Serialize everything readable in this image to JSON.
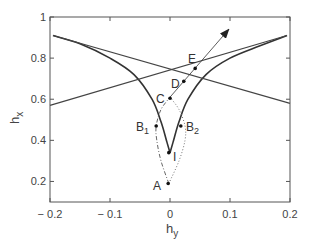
{
  "chart_data": {
    "type": "line",
    "title": "",
    "xlabel": "h_y",
    "ylabel": "h_x",
    "xlim": [
      -0.2,
      0.2
    ],
    "ylim": [
      0.1,
      1.0
    ],
    "grid": false,
    "xticks": [
      {
        "value": -0.2,
        "label": "− 0.2"
      },
      {
        "value": -0.1,
        "label": "− 0.1"
      },
      {
        "value": 0,
        "label": "0"
      },
      {
        "value": 0.1,
        "label": "0.1"
      },
      {
        "value": 0.2,
        "label": "0.2"
      }
    ],
    "yticks": [
      {
        "value": 0.2,
        "label": "0.2"
      },
      {
        "value": 0.4,
        "label": "0.4"
      },
      {
        "value": 0.6,
        "label": "0.6"
      },
      {
        "value": 0.8,
        "label": "0.8"
      },
      {
        "value": 1.0,
        "label": "1"
      }
    ],
    "series": [
      {
        "name": "astroid-left-branch",
        "style": "solid-thick",
        "points": [
          [
            -0.195,
            0.91
          ],
          [
            -0.15,
            0.87
          ],
          [
            -0.1,
            0.8
          ],
          [
            -0.06,
            0.72
          ],
          [
            -0.03,
            0.6
          ],
          [
            -0.015,
            0.49
          ],
          [
            -0.005,
            0.39
          ],
          [
            0,
            0.34
          ]
        ]
      },
      {
        "name": "astroid-right-branch",
        "style": "solid-thick",
        "points": [
          [
            0,
            0.34
          ],
          [
            0.005,
            0.39
          ],
          [
            0.015,
            0.49
          ],
          [
            0.03,
            0.6
          ],
          [
            0.06,
            0.72
          ],
          [
            0.1,
            0.8
          ],
          [
            0.15,
            0.86
          ],
          [
            0.195,
            0.91
          ]
        ]
      },
      {
        "name": "tangent-line-1",
        "style": "solid",
        "points": [
          [
            -0.195,
            0.91
          ],
          [
            0.2,
            0.58
          ]
        ]
      },
      {
        "name": "tangent-line-2",
        "style": "solid",
        "points": [
          [
            -0.2,
            0.57
          ],
          [
            0.195,
            0.91
          ]
        ]
      },
      {
        "name": "path-A-B1-C",
        "style": "dash-dot",
        "points": [
          [
            -0.002,
            0.19
          ],
          [
            -0.015,
            0.3
          ],
          [
            -0.022,
            0.4
          ],
          [
            -0.023,
            0.47
          ],
          [
            -0.015,
            0.55
          ],
          [
            0,
            0.61
          ]
        ]
      },
      {
        "name": "path-A-B2-C",
        "style": "dotted",
        "points": [
          [
            -0.002,
            0.19
          ],
          [
            0.015,
            0.3
          ],
          [
            0.025,
            0.4
          ],
          [
            0.025,
            0.47
          ],
          [
            0.015,
            0.55
          ],
          [
            0,
            0.61
          ]
        ]
      },
      {
        "name": "field-arrow",
        "style": "thin-arrow",
        "points": [
          [
            0,
            0.61
          ],
          [
            0.098,
            0.94
          ]
        ]
      }
    ],
    "annotations": [
      {
        "label": "A",
        "x": -0.003,
        "y": 0.19
      },
      {
        "label": "I",
        "x": -0.002,
        "y": 0.34
      },
      {
        "label": "B1",
        "x": -0.023,
        "y": 0.47
      },
      {
        "label": "B2",
        "x": 0.018,
        "y": 0.47
      },
      {
        "label": "C",
        "x": 0.0,
        "y": 0.605
      },
      {
        "label": "D",
        "x": 0.023,
        "y": 0.687
      },
      {
        "label": "E",
        "x": 0.042,
        "y": 0.75
      }
    ]
  },
  "labels": {
    "xlabel_main": "h",
    "xlabel_sub": "y",
    "ylabel_main": "h",
    "ylabel_sub": "x",
    "pt_A": "A",
    "pt_I": "I",
    "pt_B1_main": "B",
    "pt_B1_sub": "1",
    "pt_B2_main": "B",
    "pt_B2_sub": "2",
    "pt_C": "C",
    "pt_D": "D",
    "pt_E": "E"
  }
}
